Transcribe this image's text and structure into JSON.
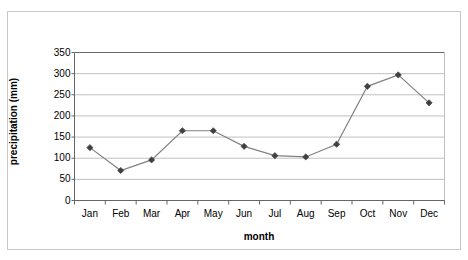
{
  "chart_data": {
    "type": "line",
    "title": "",
    "xlabel": "month",
    "ylabel": "precipitation (mm)",
    "categories": [
      "Jan",
      "Feb",
      "Mar",
      "Apr",
      "May",
      "Jun",
      "Jul",
      "Aug",
      "Sep",
      "Oct",
      "Nov",
      "Dec"
    ],
    "values": [
      125,
      71,
      96,
      165,
      165,
      128,
      106,
      103,
      133,
      270,
      297,
      231
    ],
    "series": [
      {
        "name": "precipitation",
        "values": [
          125,
          71,
          96,
          165,
          165,
          128,
          106,
          103,
          133,
          270,
          297,
          231
        ]
      }
    ],
    "ylim": [
      0,
      350
    ],
    "ytick_values": [
      0,
      50,
      100,
      150,
      200,
      250,
      300,
      350
    ],
    "ytick_labels": [
      "0",
      "50",
      "100",
      "150",
      "200",
      "250",
      "300",
      "350"
    ],
    "grid": "horizontal",
    "legend": "none",
    "marker": "diamond",
    "colors": {
      "line": "#808080",
      "marker": "#404040",
      "gridline": "#c0c0c0",
      "axis": "#808080",
      "frame": "#c9c9c9",
      "background": "#ffffff",
      "text": "#000000"
    }
  }
}
